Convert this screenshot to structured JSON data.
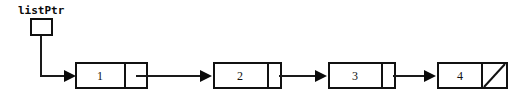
{
  "diagram": {
    "kind": "singly-linked-list",
    "width": 527,
    "height": 102,
    "background_color": "#ffffff",
    "stroke_color": "#111111",
    "pointer_variable": {
      "label": "listPtr",
      "box_x": 30,
      "box_y": 18,
      "box_width": 23,
      "box_height": 18,
      "label_x": 18,
      "label_y": 14
    },
    "node_row": {
      "top": 62,
      "height": 27,
      "data_cell_width": 50,
      "pointer_cell_width": 23
    },
    "nodes": [
      {
        "index": 0,
        "value": "1",
        "x": 75,
        "width": 73,
        "divider_x": 125,
        "next": "node-2",
        "is_null_terminated": false
      },
      {
        "index": 1,
        "value": "2",
        "x": 213,
        "width": 69,
        "divider_x": 268,
        "next": "node-3",
        "is_null_terminated": false
      },
      {
        "index": 2,
        "value": "3",
        "x": 328,
        "width": 68,
        "divider_x": 382,
        "next": "node-4",
        "is_null_terminated": false
      },
      {
        "index": 3,
        "value": "4",
        "x": 437,
        "width": 71,
        "divider_x": 482,
        "next": null,
        "is_null_terminated": true
      }
    ],
    "links": [
      {
        "name": "listptr-to-node-1",
        "from": "pointer-box",
        "to": "node-1",
        "path": "M 41 36 L 41 76 L 72 76",
        "arrow_tip_x": 76,
        "arrow_tip_y": 76
      },
      {
        "name": "node-1-to-node-2",
        "from": "node-1",
        "to": "node-2",
        "path": "M 136 76 L 210 76",
        "arrow_tip_x": 212,
        "arrow_tip_y": 76
      },
      {
        "name": "node-2-to-node-3",
        "from": "node-2",
        "to": "node-3",
        "path": "M 279 76 L 325 76",
        "arrow_tip_x": 327,
        "arrow_tip_y": 76
      },
      {
        "name": "node-3-to-node-4",
        "from": "node-3",
        "to": "node-4",
        "path": "M 393 76 L 434 76",
        "arrow_tip_x": 436,
        "arrow_tip_y": 76
      }
    ],
    "null_terminator": {
      "node": "node-4",
      "slash_x1": 484,
      "slash_y1": 87,
      "slash_x2": 506,
      "slash_y2": 64
    }
  }
}
